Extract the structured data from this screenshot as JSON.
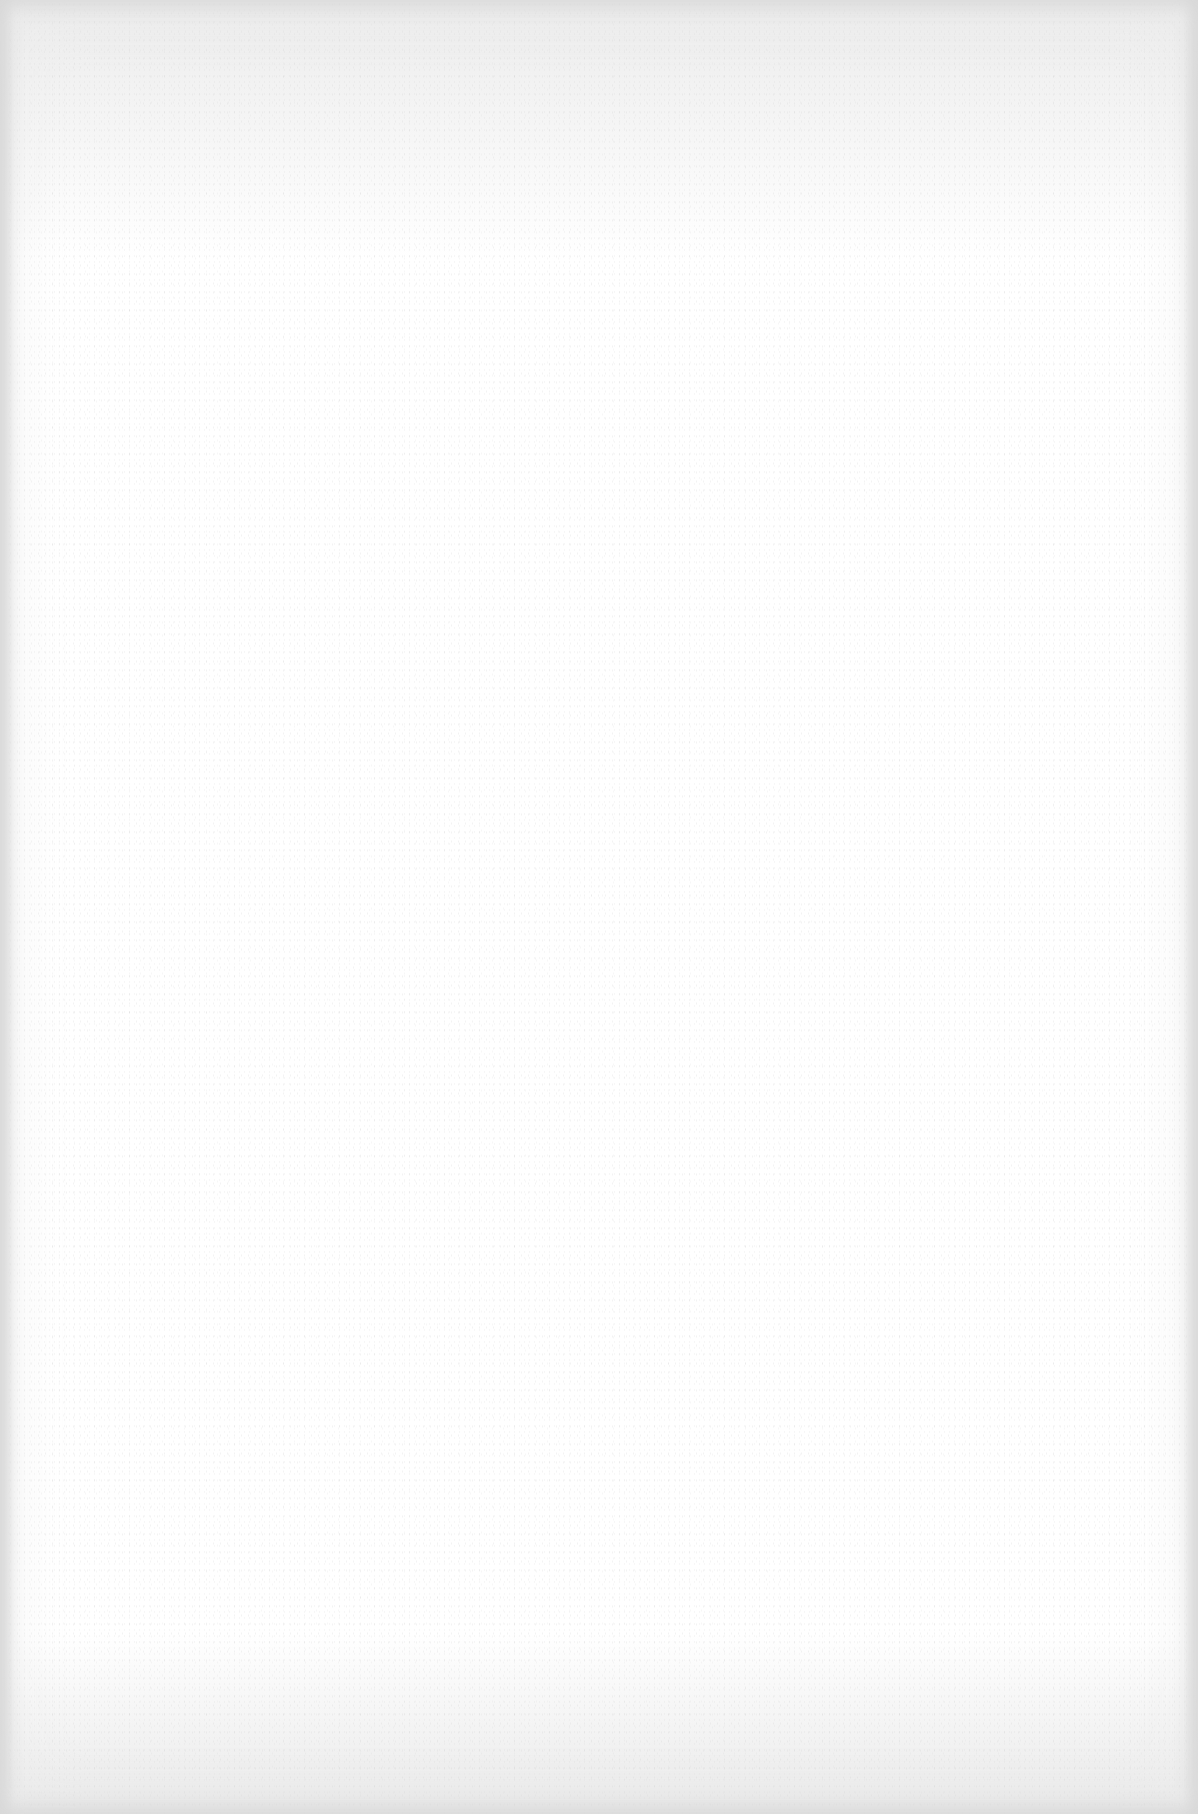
{
  "page": {
    "type": "blank-paper-scan",
    "content": "",
    "colors": {
      "paper": "#ffffff",
      "edge_shadow": "#d7d7d7",
      "grain": "#c8c8c8"
    }
  }
}
